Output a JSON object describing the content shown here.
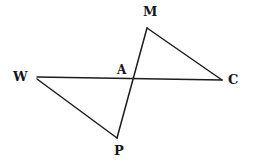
{
  "figure": {
    "type": "geometry-diagram",
    "background_color": "#ffffff",
    "stroke_color": "#1c1c20",
    "label_color": "#17171b",
    "canvas": {
      "width": 254,
      "height": 165
    },
    "points": [
      {
        "id": "W",
        "label": "W",
        "x": 37,
        "y": 78,
        "label_x": 13,
        "label_y": 70,
        "label_size": "normal"
      },
      {
        "id": "C",
        "label": "C",
        "x": 222,
        "y": 80,
        "label_x": 228,
        "label_y": 73,
        "label_size": "normal"
      },
      {
        "id": "M",
        "label": "M",
        "x": 147,
        "y": 28,
        "label_x": 143,
        "label_y": 5,
        "label_size": "normal"
      },
      {
        "id": "P",
        "label": "P",
        "x": 117,
        "y": 138,
        "label_x": 114,
        "label_y": 144,
        "label_size": "normal"
      },
      {
        "id": "A",
        "label": "A",
        "x": 134,
        "y": 80,
        "label_x": 117,
        "label_y": 64,
        "label_size": "small"
      }
    ],
    "segments": [
      {
        "id": "WC",
        "from": "W",
        "to": "C",
        "x1": 37,
        "y1": 77,
        "x2": 222,
        "y2": 80
      },
      {
        "id": "WP",
        "from": "W",
        "to": "P",
        "x1": 37,
        "y1": 79,
        "x2": 117,
        "y2": 138
      },
      {
        "id": "MC",
        "from": "M",
        "to": "C",
        "x1": 147,
        "y1": 28,
        "x2": 222,
        "y2": 80
      },
      {
        "id": "MP",
        "from": "M",
        "to": "P",
        "x1": 147,
        "y1": 28,
        "x2": 117,
        "y2": 138
      }
    ]
  }
}
